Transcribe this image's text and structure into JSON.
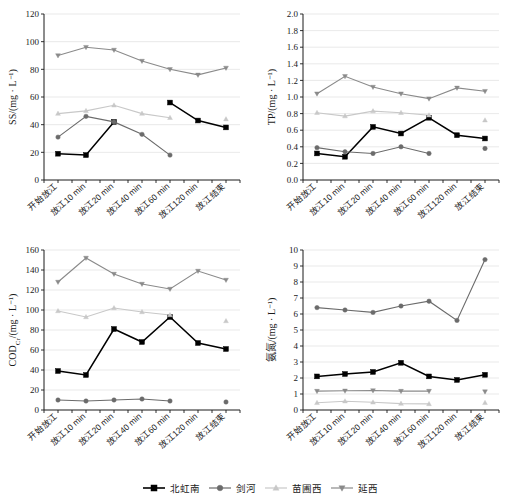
{
  "figure": {
    "title": "",
    "categories": [
      "开始放江",
      "放江10 min",
      "放江20 min",
      "放江40 min",
      "放江60 min",
      "放江120 min",
      "放江结束"
    ]
  },
  "legend": {
    "position": "bottom-center",
    "items": [
      {
        "label": "北虹南",
        "marker": "square",
        "color": "#000000"
      },
      {
        "label": "剑河",
        "marker": "circle",
        "color": "#6b6b6b"
      },
      {
        "label": "苗圃西",
        "marker": "triangle-up",
        "color": "#c8c8c8"
      },
      {
        "label": "延西",
        "marker": "triangle-down",
        "color": "#8a8a8a"
      }
    ]
  },
  "chart_data": [
    {
      "id": "ss",
      "type": "line",
      "title": "",
      "xlabel": "",
      "ylabel": "SS/(mg · L⁻¹)",
      "ylim": [
        0,
        120
      ],
      "yticks": [
        0,
        20,
        40,
        60,
        80,
        100,
        120
      ],
      "grid": true,
      "categories": [
        "开始放江",
        "放江10 min",
        "放江20 min",
        "放江40 min",
        "放江60 min",
        "放江120 min",
        "放江结束"
      ],
      "series": [
        {
          "name": "北虹南",
          "marker": "square",
          "color": "#000000",
          "values": [
            19,
            18,
            42,
            null,
            56,
            43,
            38
          ]
        },
        {
          "name": "剑河",
          "marker": "circle",
          "color": "#6b6b6b",
          "values": [
            31,
            46,
            42,
            33,
            18,
            null,
            null
          ]
        },
        {
          "name": "苗圃西",
          "marker": "triangle-up",
          "color": "#c8c8c8",
          "values": [
            48,
            50,
            54,
            48,
            45,
            null,
            44
          ]
        },
        {
          "name": "延西",
          "marker": "triangle-down",
          "color": "#8a8a8a",
          "values": [
            90,
            96,
            94,
            86,
            80,
            76,
            81
          ]
        }
      ]
    },
    {
      "id": "tp",
      "type": "line",
      "title": "",
      "xlabel": "",
      "ylabel": "TP/(mg · L⁻¹)",
      "ylim": [
        0.0,
        2.0
      ],
      "yticks": [
        0.0,
        0.2,
        0.4,
        0.6,
        0.8,
        1.0,
        1.2,
        1.4,
        1.6,
        1.8,
        2.0
      ],
      "grid": true,
      "categories": [
        "开始放江",
        "放江10 min",
        "放江20 min",
        "放江40 min",
        "放江60 min",
        "放江120 min",
        "放江结束"
      ],
      "series": [
        {
          "name": "北虹南",
          "marker": "square",
          "color": "#000000",
          "values": [
            0.32,
            0.28,
            0.64,
            0.56,
            0.75,
            0.54,
            0.5
          ]
        },
        {
          "name": "剑河",
          "marker": "circle",
          "color": "#6b6b6b",
          "values": [
            0.39,
            0.34,
            0.32,
            0.4,
            0.32,
            null,
            0.38
          ]
        },
        {
          "name": "苗圃西",
          "marker": "triangle-up",
          "color": "#c8c8c8",
          "values": [
            0.81,
            0.77,
            0.83,
            0.81,
            0.78,
            null,
            0.72
          ]
        },
        {
          "name": "延西",
          "marker": "triangle-down",
          "color": "#8a8a8a",
          "values": [
            1.04,
            1.25,
            1.12,
            1.04,
            0.98,
            1.11,
            1.07
          ]
        }
      ]
    },
    {
      "id": "cod",
      "type": "line",
      "title": "",
      "xlabel": "",
      "ylabel": "CODCr/(mg · L⁻¹)",
      "ylabel_base": "COD",
      "ylabel_sub": "Cr",
      "ylabel_unit": "/(mg · L⁻¹)",
      "ylim": [
        0,
        160
      ],
      "yticks": [
        0,
        20,
        40,
        60,
        80,
        100,
        120,
        140,
        160
      ],
      "grid": true,
      "categories": [
        "开始放江",
        "放江10 min",
        "放江20 min",
        "放江40 min",
        "放江60 min",
        "放江120 min",
        "放江结束"
      ],
      "series": [
        {
          "name": "北虹南",
          "marker": "square",
          "color": "#000000",
          "values": [
            39,
            35,
            81,
            68,
            93,
            67,
            61
          ]
        },
        {
          "name": "剑河",
          "marker": "circle",
          "color": "#6b6b6b",
          "values": [
            10,
            9,
            10,
            11,
            9,
            null,
            8
          ]
        },
        {
          "name": "苗圃西",
          "marker": "triangle-up",
          "color": "#c8c8c8",
          "values": [
            99,
            93,
            102,
            98,
            95,
            null,
            89
          ]
        },
        {
          "name": "延西",
          "marker": "triangle-down",
          "color": "#8a8a8a",
          "values": [
            128,
            152,
            136,
            126,
            121,
            139,
            130
          ]
        }
      ]
    },
    {
      "id": "nh",
      "type": "line",
      "title": "",
      "xlabel": "",
      "ylabel": "氨氮/(mg · L⁻¹)",
      "ylim": [
        0,
        10
      ],
      "yticks": [
        0,
        1,
        2,
        3,
        4,
        5,
        6,
        7,
        8,
        9,
        10
      ],
      "grid": true,
      "categories": [
        "开始放江",
        "放江10 min",
        "放江20 min",
        "放江40 min",
        "放江60 min",
        "放江120 min",
        "放江结束"
      ],
      "series": [
        {
          "name": "北虹南",
          "marker": "square",
          "color": "#000000",
          "values": [
            2.1,
            2.25,
            2.38,
            2.95,
            2.1,
            1.88,
            2.2
          ]
        },
        {
          "name": "剑河",
          "marker": "circle",
          "color": "#6b6b6b",
          "values": [
            6.4,
            6.25,
            6.1,
            6.5,
            6.8,
            5.6,
            9.4
          ]
        },
        {
          "name": "苗圃西",
          "marker": "triangle-up",
          "color": "#c8c8c8",
          "values": [
            0.45,
            0.55,
            0.48,
            0.4,
            0.38,
            null,
            0.45
          ]
        },
        {
          "name": "延西",
          "marker": "triangle-down",
          "color": "#8a8a8a",
          "values": [
            1.18,
            1.2,
            1.22,
            1.18,
            1.18,
            null,
            1.15
          ]
        }
      ]
    }
  ]
}
